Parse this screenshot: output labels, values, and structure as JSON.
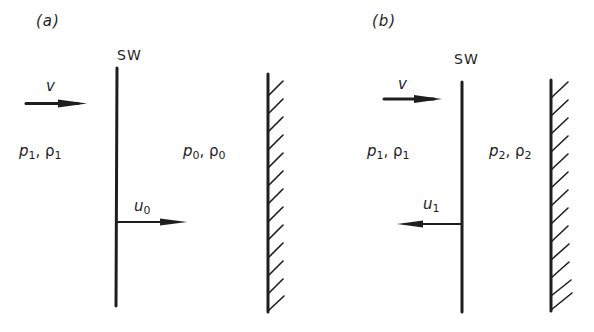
{
  "diagram": {
    "colors": {
      "ink": "#1e1e1e",
      "background": "#ffffff"
    },
    "panels": [
      {
        "id": "a",
        "label": "(a)",
        "shock_wave_label": "SW",
        "incoming_flow": {
          "symbol": "v",
          "direction": "right"
        },
        "region_left": {
          "pressure": "p",
          "pressure_sub": "1",
          "density": "ρ",
          "density_sub": "1",
          "separator": ", "
        },
        "region_right": {
          "pressure": "p",
          "pressure_sub": "0",
          "density": "ρ",
          "density_sub": "0",
          "separator": ", "
        },
        "shock_velocity": {
          "symbol": "u",
          "sub": "0",
          "direction": "right"
        },
        "wall": "hatched-rigid-wall"
      },
      {
        "id": "b",
        "label": "(b)",
        "shock_wave_label": "SW",
        "incoming_flow": {
          "symbol": "v",
          "direction": "right"
        },
        "region_left": {
          "pressure": "p",
          "pressure_sub": "1",
          "density": "ρ",
          "density_sub": "1",
          "separator": ", "
        },
        "region_right": {
          "pressure": "p",
          "pressure_sub": "2",
          "density": "ρ",
          "density_sub": "2",
          "separator": ", "
        },
        "shock_velocity": {
          "symbol": "u",
          "sub": "1",
          "direction": "left"
        },
        "wall": "hatched-rigid-wall"
      }
    ]
  }
}
